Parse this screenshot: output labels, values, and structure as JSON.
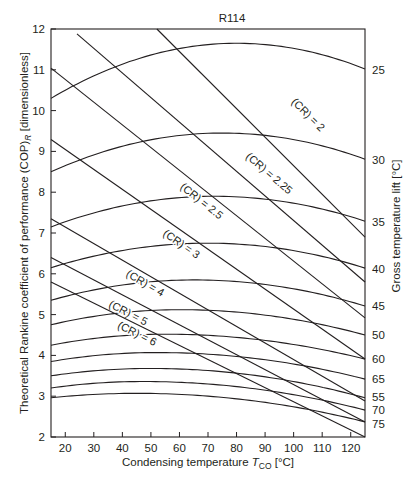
{
  "chart_data": {
    "type": "line",
    "title": "R114",
    "xlabel": "Condensing temperature T_CO [°C]",
    "xlabel_main": "Condensing temperature ",
    "xlabel_T": "T",
    "xlabel_sub": "CO",
    "xlabel_unit": " [°C]",
    "ylabel": "Theoretical Rankine coefficient of performance (COP)_R [dimensionless]",
    "ylabel_main": "Theoretical Rankine coefficient of performance (COP)",
    "ylabel_sub": "R",
    "ylabel_unit": " [dimensionless]",
    "y2label": "Gross temperature lift [°C]",
    "xlim": [
      15,
      125
    ],
    "ylim": [
      2,
      12
    ],
    "xticks": [
      20,
      30,
      40,
      50,
      60,
      70,
      80,
      90,
      100,
      110,
      120
    ],
    "yticks": [
      2,
      3,
      4,
      5,
      6,
      7,
      8,
      9,
      10,
      11,
      12
    ],
    "grid": false,
    "legend": "none",
    "lift_curves": [
      {
        "name": "25",
        "left": 10.3,
        "peak_x": 80,
        "peak": 11.65,
        "right": 11.02,
        "label_y": 11.0
      },
      {
        "name": "30",
        "left": 8.5,
        "peak_x": 75,
        "peak": 9.45,
        "right": 8.81,
        "label_y": 8.78
      },
      {
        "name": "35",
        "left": 7.15,
        "peak_x": 72,
        "peak": 7.9,
        "right": 7.29,
        "label_y": 7.26
      },
      {
        "name": "40",
        "left": 6.15,
        "peak_x": 70,
        "peak": 6.75,
        "right": 6.14,
        "label_y": 6.12
      },
      {
        "name": "45",
        "left": 5.35,
        "peak_x": 65,
        "peak": 5.85,
        "right": 5.21,
        "label_y": 5.2
      },
      {
        "name": "50",
        "left": 4.75,
        "peak_x": 60,
        "peak": 5.12,
        "right": 4.5,
        "label_y": 4.49
      },
      {
        "name": "60",
        "left": 4.25,
        "peak_x": 55,
        "peak": 4.52,
        "right": 3.91,
        "label_y": 3.9
      },
      {
        "name": "65",
        "left": 3.85,
        "peak_x": 52,
        "peak": 4.07,
        "right": 3.42,
        "label_y": 3.41
      },
      {
        "name": "55",
        "left": 3.5,
        "peak_x": 50,
        "peak": 3.68,
        "right": 2.96,
        "label_y": 2.97
      },
      {
        "name": "70",
        "left": 3.2,
        "peak_x": 47,
        "peak": 3.36,
        "right": 2.66,
        "label_y": 2.66
      },
      {
        "name": "75",
        "left": 2.96,
        "peak_x": 45,
        "peak": 3.07,
        "right": 2.37,
        "label_y": 2.32
      }
    ],
    "cr_lines": [
      {
        "name": "(CR) = 2",
        "x1": 52.1,
        "y1": 12.0,
        "x2": 125,
        "y2": 6.9,
        "label_x": 99,
        "label_y": 10.2
      },
      {
        "name": "(CR) = 2.25",
        "x1": 24.1,
        "y1": 11.88,
        "x2": 125,
        "y2": 5.8,
        "label_x": 83,
        "label_y": 8.85
      },
      {
        "name": "(CR) = 2.5",
        "x1": 15,
        "y1": 11.04,
        "x2": 125,
        "y2": 4.92,
        "label_x": 60,
        "label_y": 8.1
      },
      {
        "name": "(CR) = 3",
        "x1": 15,
        "y1": 9.29,
        "x2": 125,
        "y2": 3.91,
        "label_x": 54,
        "label_y": 6.95
      },
      {
        "name": "(CR) = 4",
        "x1": 15,
        "y1": 7.35,
        "x2": 125,
        "y2": 2.88,
        "label_x": 41,
        "label_y": 5.95
      },
      {
        "name": "(CR) = 5",
        "x1": 15,
        "y1": 6.4,
        "x2": 125,
        "y2": 2.37,
        "label_x": 35,
        "label_y": 5.2
      },
      {
        "name": "(CR) = 6",
        "x1": 15,
        "y1": 5.8,
        "x2": 125,
        "y2": 2.0,
        "label_x": 38,
        "label_y": 4.68
      }
    ]
  }
}
